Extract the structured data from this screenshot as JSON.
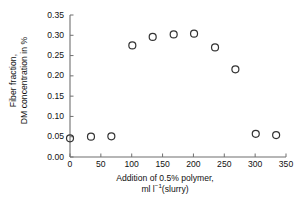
{
  "chart_data": {
    "type": "scatter",
    "title": "",
    "xlabel": "Addition of 0.5% polymer, ml l⁻¹(slurry)",
    "xlabel_line1": "Addition of 0.5% polymer,",
    "xlabel_line2_pre": "ml l",
    "xlabel_line2_sup": "−1",
    "xlabel_line2_post": "(slurry)",
    "ylabel": "Fiber fraction, DM concentration in %",
    "ylabel_line1": "Fiber fraction,",
    "ylabel_line2": "DM concentration in %",
    "xlim": [
      0,
      350
    ],
    "ylim": [
      0.0,
      0.35
    ],
    "xticks": [
      0,
      50,
      100,
      150,
      200,
      250,
      300,
      350
    ],
    "xtick_labels": [
      "0",
      "50",
      "100",
      "150",
      "200",
      "250",
      "300",
      "350"
    ],
    "yticks": [
      0.0,
      0.05,
      0.1,
      0.15,
      0.2,
      0.25,
      0.3,
      0.35
    ],
    "ytick_labels": [
      "0.00",
      "0.05",
      "0.10",
      "0.15",
      "0.20",
      "0.25",
      "0.30",
      "0.35"
    ],
    "grid": false,
    "legend": null,
    "marker": "open-circle",
    "marker_color": "#333333",
    "series": [
      {
        "name": "Fiber fraction DM concentration",
        "x": [
          0,
          34,
          67,
          101,
          134,
          168,
          201,
          235,
          268,
          301,
          334
        ],
        "y": [
          0.046,
          0.05,
          0.051,
          0.275,
          0.296,
          0.302,
          0.304,
          0.27,
          0.216,
          0.057,
          0.054
        ]
      }
    ]
  },
  "figure": {
    "background": "#ffffff",
    "axis_color": "#6f6f6f",
    "text_color": "#111111"
  }
}
